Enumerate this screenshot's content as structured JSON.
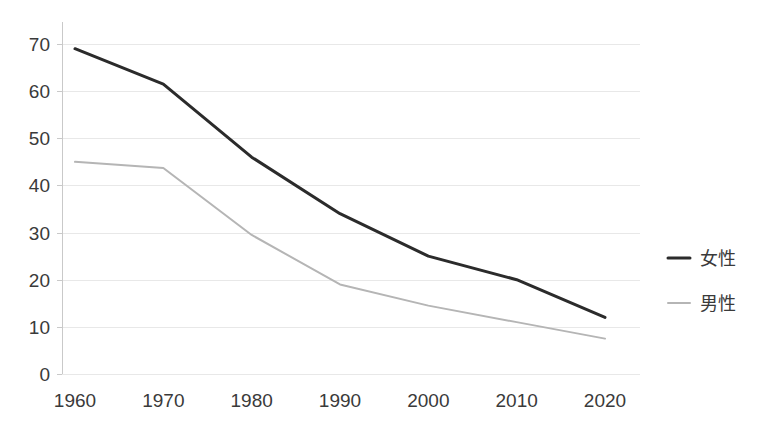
{
  "chart_data": {
    "type": "line",
    "title": "",
    "subtitle": "",
    "xlabel": "",
    "ylabel": "",
    "categories": [
      "1960",
      "1970",
      "1980",
      "1990",
      "2000",
      "2010",
      "2020"
    ],
    "x": [
      1960,
      1970,
      1980,
      1990,
      2000,
      2010,
      2020
    ],
    "series": [
      {
        "name": "女性",
        "color": "#2b2b2b",
        "line_width": 3,
        "values": [
          69,
          61.5,
          46,
          34,
          25,
          20,
          12
        ]
      },
      {
        "name": "男性",
        "color": "#b5b5b5",
        "line_width": 2,
        "values": [
          45,
          43.7,
          29.5,
          19,
          14.5,
          11,
          7.5
        ]
      }
    ],
    "ylim": [
      0,
      70
    ],
    "yticks": [
      "0",
      "10",
      "20",
      "30",
      "40",
      "50",
      "60",
      "70"
    ],
    "ytick_values": [
      0,
      10,
      20,
      30,
      40,
      50,
      60,
      70
    ],
    "xticks": [
      "1960",
      "1970",
      "1980",
      "1990",
      "2000",
      "2010",
      "2020"
    ],
    "grid": "horizontal",
    "grid_color": "#e8e8e8",
    "axis_color": "#c9c9c9",
    "background": "#ffffff",
    "legend_position": "right"
  },
  "legend": {
    "items": [
      {
        "label": "女性",
        "color": "#2b2b2b",
        "width": 3
      },
      {
        "label": "男性",
        "color": "#b5b5b5",
        "width": 2
      }
    ]
  }
}
